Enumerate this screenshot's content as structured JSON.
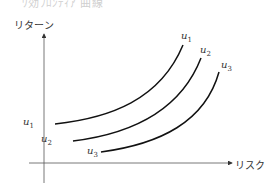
{
  "header": {
    "partial_text": "ﾜ効ﾌﾛﾝﾃｨｱ 曲線"
  },
  "diagram": {
    "y_axis_label": "リターン",
    "x_axis_label": "リスク",
    "curves": [
      {
        "name": "u",
        "sub": "1"
      },
      {
        "name": "u",
        "sub": "2"
      },
      {
        "name": "u",
        "sub": "3"
      }
    ],
    "colors": {
      "line": "#111111",
      "axis": "#333333"
    }
  }
}
